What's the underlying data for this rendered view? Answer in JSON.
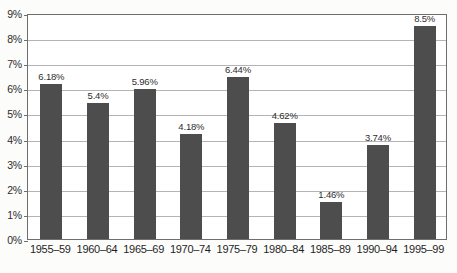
{
  "chart_data": {
    "type": "bar",
    "title": "",
    "subtitle": "",
    "xlabel": "",
    "ylabel": "",
    "categories": [
      "1955–59",
      "1960–64",
      "1965–69",
      "1970–74",
      "1975–79",
      "1980–84",
      "1985–89",
      "1990–94",
      "1995–99"
    ],
    "values": [
      6.18,
      5.4,
      5.96,
      4.18,
      6.44,
      4.62,
      1.46,
      3.74,
      8.5
    ],
    "data_labels": [
      "6.18%",
      "5.4%",
      "5.96%",
      "4.18%",
      "6.44%",
      "4.62%",
      "1.46%",
      "3.74%",
      "8.5%"
    ],
    "ylim": [
      0,
      9
    ],
    "y_tick_step": 1,
    "y_tick_labels": [
      "9%",
      "8%",
      "7%",
      "6%",
      "5%",
      "4%",
      "3%",
      "2%",
      "1%",
      "0%"
    ],
    "y_tick_values": [
      9,
      8,
      7,
      6,
      5,
      4,
      3,
      2,
      1,
      0
    ],
    "grid": true,
    "grid_axis": "y",
    "legend": false,
    "legend_position": "none",
    "series": [
      {
        "name": "",
        "values": [
          6.18,
          5.4,
          5.96,
          4.18,
          6.44,
          4.62,
          1.46,
          3.74,
          8.5
        ]
      }
    ],
    "colors": {
      "bar": "#4d4d4d",
      "grid": "#b4b4b4",
      "axis": "#6e6e6e",
      "plot_background": "#ffffff",
      "figure_background": "#fcfcfb",
      "text": "#2c2c2c"
    }
  }
}
